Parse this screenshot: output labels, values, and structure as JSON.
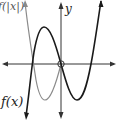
{
  "diagram": {
    "type": "function-graph",
    "labels": {
      "f_abs": "f(|x|)",
      "f": "f(x)",
      "y_axis": "y"
    },
    "colors": {
      "f_curve": "#1a1a1a",
      "f_abs_curve": "#8a8a8a",
      "axes": "#333333"
    },
    "curves": [
      {
        "name": "f(x)",
        "style": "dark",
        "description": "cubic with local max left of y-axis, passes through origin, local min right of y-axis"
      },
      {
        "name": "f(|x|)",
        "style": "gray",
        "description": "left half is reflection of right half of f(x) across y-axis"
      }
    ],
    "marker": {
      "type": "open-circle",
      "at": "origin"
    }
  }
}
